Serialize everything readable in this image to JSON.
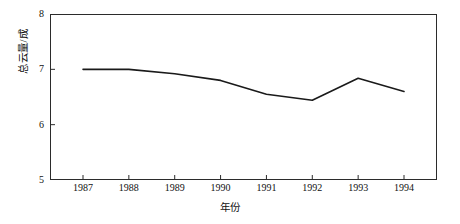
{
  "chart_data": {
    "type": "line",
    "title": "",
    "xlabel": "年份",
    "ylabel": "总云量/成",
    "categories": [
      "1987",
      "1988",
      "1989",
      "1990",
      "1991",
      "1992",
      "1993",
      "1994"
    ],
    "x": [
      1987,
      1988,
      1989,
      1990,
      1991,
      1992,
      1993,
      1994
    ],
    "values": [
      7.0,
      7.0,
      6.92,
      6.8,
      6.55,
      6.44,
      6.84,
      6.6
    ],
    "series": [
      {
        "name": "总云量",
        "values": [
          7.0,
          7.0,
          6.92,
          6.8,
          6.55,
          6.44,
          6.84,
          6.6
        ]
      }
    ],
    "ylim": [
      5,
      8
    ],
    "xlim": [
      1987,
      1994
    ],
    "y_ticks": [
      5,
      6,
      7,
      8
    ],
    "y_tick_labels": [
      "5",
      "6",
      "7",
      "8"
    ],
    "x_ticks": [
      1987,
      1988,
      1989,
      1990,
      1991,
      1992,
      1993,
      1994
    ],
    "x_tick_labels": [
      "1987",
      "1988",
      "1989",
      "1990",
      "1991",
      "1992",
      "1993",
      "1994"
    ],
    "grid": false,
    "legend": false,
    "legend_position": "none",
    "line_color": "#1a1a1a",
    "line_width": 1.6,
    "markers": false,
    "background_color": "#ffffff",
    "axis_color": "#2b2b2b",
    "annotations": []
  }
}
